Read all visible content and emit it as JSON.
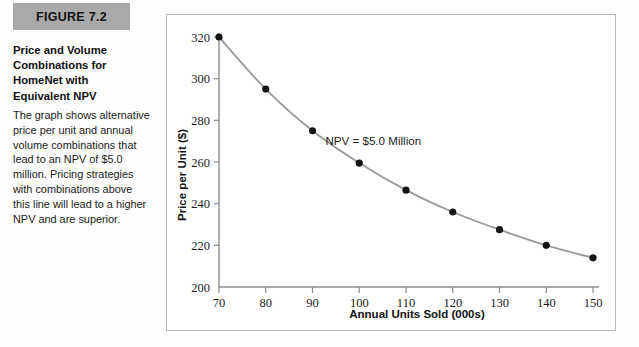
{
  "figure": {
    "tag": "FIGURE 7.2",
    "title": "Price and Volume Combinations for HomeNet with Equivalent NPV",
    "body": "The graph shows alternative price per unit and annual volume combinations that lead to an NPV of $5.0 million. Pricing strategies with combinations above this line will lead to a higher NPV and are superior."
  },
  "colors": {
    "tag_background": "#a9a9a9",
    "frame_border": "#b9b9b9",
    "axis": "#8d8d8d",
    "curve": "#9b9b9b",
    "marker": "#141414",
    "page_background": "#fdfdfd"
  },
  "chart_data": {
    "type": "line",
    "title": "",
    "xlabel": "Annual Units Sold (000s)",
    "ylabel": "Price per Unit ($)",
    "xlim": [
      70,
      150
    ],
    "ylim": [
      200,
      320
    ],
    "xticks": [
      70,
      80,
      90,
      100,
      110,
      120,
      130,
      140,
      150
    ],
    "xticklabels": [
      "70",
      "80",
      "90",
      "100",
      "110",
      "120",
      "130",
      "140",
      "150"
    ],
    "yticks": [
      200,
      220,
      240,
      260,
      280,
      300,
      320
    ],
    "yticklabels": [
      "200",
      "220",
      "240",
      "260",
      "280",
      "300",
      "320"
    ],
    "grid": false,
    "legend": false,
    "markers": true,
    "x": [
      70,
      80,
      90,
      100,
      110,
      120,
      130,
      140,
      150
    ],
    "values": [
      320,
      295,
      275,
      259.5,
      246.5,
      236,
      227.5,
      220,
      214
    ],
    "series": [
      {
        "name": "NPV = $5.0 Million",
        "values": [
          320,
          295,
          275,
          259.5,
          246.5,
          236,
          227.5,
          220,
          214
        ]
      }
    ],
    "annotations": [
      {
        "text": "NPV = $5.0 Million",
        "x": 103,
        "y": 268
      }
    ]
  }
}
